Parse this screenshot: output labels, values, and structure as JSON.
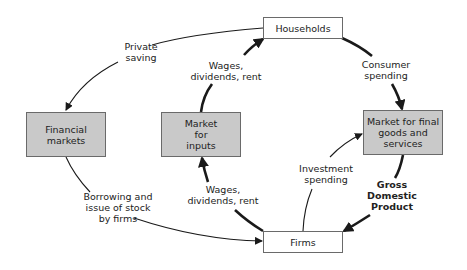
{
  "diagram": {
    "type": "circular-flow",
    "nodes": {
      "households": {
        "label": "Households"
      },
      "firms": {
        "label": "Firms"
      },
      "financial_markets": {
        "label": "Financial\nmarkets"
      },
      "market_inputs": {
        "label": "Market\nfor\ninputs"
      },
      "market_final_goods": {
        "label": "Market for final\ngoods and\nservices"
      }
    },
    "edges": {
      "private_saving": {
        "label": "Private\nsaving",
        "from": "Households",
        "to": "Financial markets"
      },
      "wages_to_households": {
        "label": "Wages,\ndividends, rent",
        "from": "Market for inputs",
        "to": "Households"
      },
      "consumer_spending": {
        "label": "Consumer\nspending",
        "from": "Households",
        "to": "Market for final goods and services"
      },
      "borrowing": {
        "label": "Borrowing and\nissue of stock\nby firms",
        "from": "Financial markets",
        "to": "Firms"
      },
      "wages_to_market": {
        "label": "Wages,\ndividends, rent",
        "from": "Firms",
        "to": "Market for inputs"
      },
      "investment_spending": {
        "label": "Investment\nspending",
        "from": "Firms",
        "to": "Market for final goods and services"
      },
      "gdp": {
        "label": "Gross\nDomestic\nProduct",
        "from": "Market for final goods and services",
        "to": "Firms"
      }
    },
    "colors": {
      "gray_box": "#c9c9c9",
      "white_box": "#ffffff",
      "border": "#6a6a6a",
      "arrow": "#1a1a1a"
    }
  }
}
